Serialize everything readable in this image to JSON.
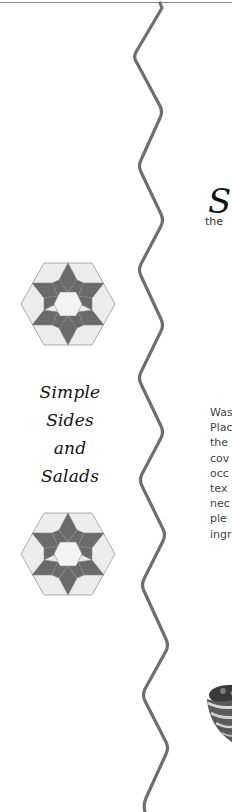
{
  "page": {
    "colors": {
      "background": "#ffffff",
      "wave_line": "#6e6e6e",
      "quilt_dark": "#6a6a6a",
      "quilt_light": "#e4e4e4",
      "text_dark": "#111111",
      "text_body": "#444444"
    }
  },
  "sidebar": {
    "title_lines": [
      "Simple",
      "Sides",
      "and",
      "Salads"
    ],
    "ornaments": [
      "quilt-star-icon",
      "quilt-star-icon"
    ]
  },
  "main": {
    "heading_initial": "S",
    "heading_sub": "the",
    "body_lines": [
      "Was",
      "Plac",
      "the",
      "cov",
      "occ",
      "tex",
      "nec",
      "ple",
      "ingr"
    ],
    "illustration": "bowl-illustration"
  }
}
